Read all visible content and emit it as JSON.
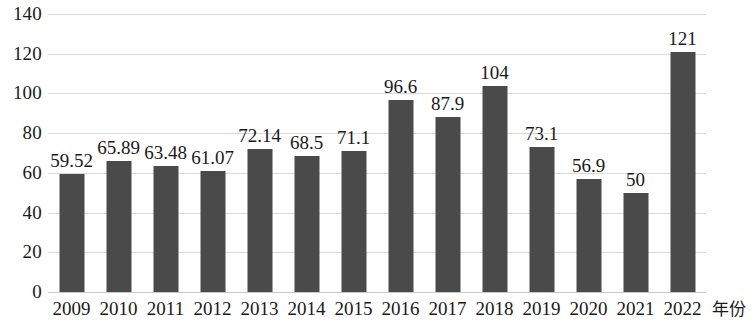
{
  "chart_data": {
    "type": "bar",
    "title": "",
    "subtitle": "",
    "xlabel": "年份",
    "ylabel": "",
    "ylim": [
      0,
      140
    ],
    "ytick_step": 20,
    "yticks": [
      "140",
      "120",
      "100",
      "80",
      "60",
      "40",
      "20",
      "0"
    ],
    "grid": true,
    "legend": false,
    "legend_position": "none",
    "bar_color": "#4a4a4a",
    "gridline_color": "#d9d9d9",
    "categories": [
      "2009",
      "2010",
      "2011",
      "2012",
      "2013",
      "2014",
      "2015",
      "2016",
      "2017",
      "2018",
      "2019",
      "2020",
      "2021",
      "2022"
    ],
    "values": [
      59.52,
      65.89,
      63.48,
      61.07,
      72.14,
      68.5,
      71.1,
      96.6,
      87.9,
      104,
      73.1,
      56.9,
      50,
      121
    ],
    "data_labels": [
      "59.52",
      "65.89",
      "63.48",
      "61.07",
      "72.14",
      "68.5",
      "71.1",
      "96.6",
      "87.9",
      "104",
      "73.1",
      "56.9",
      "50",
      "121"
    ]
  }
}
